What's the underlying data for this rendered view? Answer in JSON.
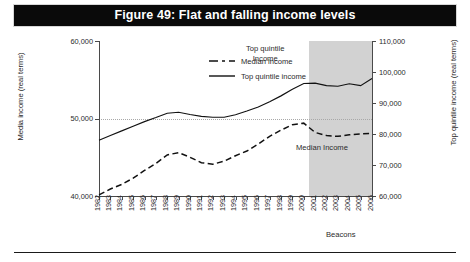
{
  "figure": {
    "title": "Figure 49: Flat and falling income levels"
  },
  "legend": {
    "position": "top-left-inside",
    "items": [
      {
        "label": "Median income",
        "style": "dashed"
      },
      {
        "label": "Top quintile income",
        "style": "solid"
      }
    ]
  },
  "annotations": [
    {
      "name": "top-quintile-annotation",
      "line1": "Top quintile",
      "line2": "Income"
    },
    {
      "name": "median-annotation",
      "text": "Median Income"
    },
    {
      "name": "band-label",
      "text": "Beacons"
    }
  ],
  "colors": {
    "title_bar": "#0a0a0a",
    "title_text": "#ffffff",
    "line": "#111111",
    "shade_band": "#d2d2d2",
    "grid": "#a8a8a8",
    "axis": "#4a4a4a"
  },
  "chart_data": {
    "type": "line",
    "title": "Figure 49: Flat and falling income levels",
    "xlabel": "",
    "ylabel": "Media income (real terms)",
    "y2label": "Top quintile income (real terms)",
    "grid": true,
    "legend_position": "upper left",
    "categories": [
      "1982",
      "1983",
      "1984",
      "1985",
      "1986",
      "1987",
      "1988",
      "1989",
      "1990",
      "1991",
      "1992",
      "1993",
      "1994",
      "1995",
      "1996",
      "1997",
      "1998",
      "1999",
      "2000",
      "2001",
      "2002",
      "2003",
      "2004",
      "2005",
      "2006"
    ],
    "ylim": [
      40000,
      60000
    ],
    "yticks": [
      40000,
      50000,
      60000
    ],
    "ytick_labels": [
      "40,000",
      "50,000",
      "60,000"
    ],
    "y2lim": [
      60000,
      110000
    ],
    "y2ticks": [
      60000,
      70000,
      80000,
      90000,
      100000,
      110000
    ],
    "y2tick_labels": [
      "60,000",
      "70,000",
      "80,000",
      "90,000",
      "100,000",
      "110,000"
    ],
    "shaded_region": {
      "label": "Beacons",
      "from": "2001",
      "to": "2006"
    },
    "series": [
      {
        "name": "Median income",
        "axis": "left",
        "style": "dashed",
        "values": [
          40150,
          40900,
          41500,
          42300,
          43300,
          44200,
          45300,
          45600,
          45000,
          44300,
          44100,
          44500,
          45200,
          45800,
          46700,
          47700,
          48500,
          49200,
          49400,
          48200,
          47800,
          47700,
          47900,
          48000,
          48100
        ]
      },
      {
        "name": "Top quintile income",
        "axis": "right",
        "style": "solid",
        "values": [
          78000,
          79500,
          81000,
          82500,
          84000,
          85300,
          86700,
          87000,
          86300,
          85700,
          85400,
          85400,
          86200,
          87400,
          88700,
          90400,
          92300,
          94400,
          96300,
          96400,
          95600,
          95400,
          96200,
          95600,
          97900
        ]
      }
    ]
  }
}
